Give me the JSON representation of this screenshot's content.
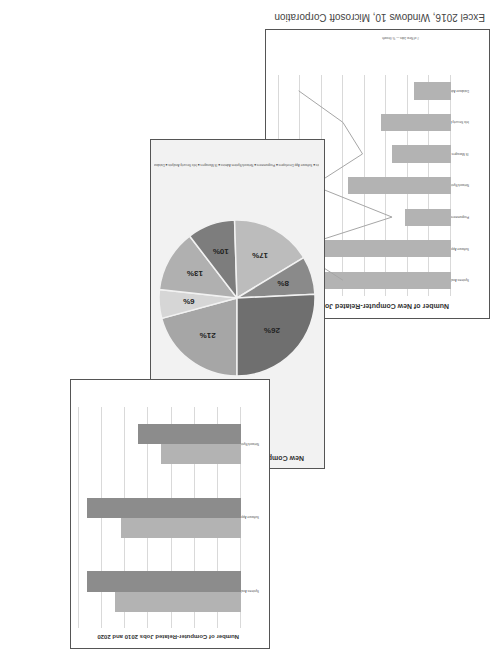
{
  "caption": "Excel 2016, Windows 10, Microsoft Corporation",
  "chart_data": [
    {
      "type": "bar",
      "title": "Number of Computer-Related Jobs 2010 and 2020",
      "categories": [
        "Systems Analysts",
        "Software App Developers",
        "Network/System Admins"
      ],
      "series": [
        {
          "name": "2010",
          "values": [
            545000,
            520000,
            345000
          ]
        },
        {
          "name": "2020",
          "values": [
            665000,
            665000,
            445000
          ]
        }
      ],
      "legend": [
        "2010",
        "2020"
      ],
      "legend_position": "bottom",
      "grid": true
    },
    {
      "type": "pie",
      "title": "New Computer-Related Jobs by 2020",
      "categories": [
        "Systems Analysts",
        "Software App Developers",
        "Programmers",
        "Network/System Admins",
        "IS Managers",
        "Info Security Analysts",
        "Database Administrators"
      ],
      "values": [
        21,
        6,
        13,
        10,
        17,
        8,
        26
      ],
      "labels": [
        "21%",
        "6%",
        "13%",
        "10%",
        "17%",
        "8%",
        "26%"
      ],
      "legend_position": "bottom"
    },
    {
      "type": "bar",
      "title": "Number of New Computer-Related Jobs by 2020",
      "categories": [
        "Systems Analysts",
        "Software App Developers",
        "Programmers",
        "Network/System Admins",
        "IS Managers",
        "Info Security Analysts",
        "Database Administrators"
      ],
      "series": [
        {
          "name": "# of New Jobs",
          "type": "bar",
          "values": [
            120000,
            143000,
            43000,
            96000,
            55000,
            65000,
            34000
          ]
        },
        {
          "name": "% Growth",
          "type": "line",
          "values": [
            22,
            32,
            12,
            28,
            18,
            22,
            31
          ]
        }
      ],
      "y_ticks": [
        "0",
        "20,000",
        "40,000",
        "60,000",
        "80,000",
        "100,000",
        "120,000",
        "140,000",
        "160,000"
      ],
      "y2_ticks": [
        "0%",
        "5%",
        "10%",
        "15%",
        "20%",
        "25%",
        "30%",
        "35%"
      ],
      "ylim": [
        0,
        160000
      ],
      "legend": [
        "# of New Jobs",
        "% Growth"
      ],
      "legend_position": "bottom",
      "grid": true
    }
  ],
  "colors": {
    "bar_dark": "#8c8c8c",
    "bar_light": "#b3b3b3",
    "line": "#a6a6a6",
    "pie": [
      "#a6a6a6",
      "#d6d6d6",
      "#b0b0b0",
      "#7d7d7d",
      "#bcbcbc",
      "#8a8a8a",
      "#6f6f6f"
    ]
  }
}
